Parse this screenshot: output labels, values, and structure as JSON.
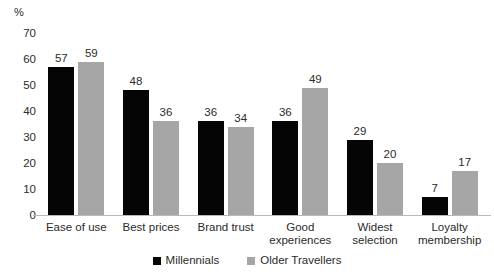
{
  "chart_data": {
    "type": "bar",
    "title": "",
    "subtitle": "",
    "xlabel": "",
    "ylabel": "%",
    "ylim": [
      0,
      70
    ],
    "yticks": [
      70,
      60,
      50,
      40,
      30,
      20,
      10,
      0
    ],
    "grid": false,
    "legend_position": "bottom",
    "categories": [
      "Ease of use",
      "Best prices",
      "Brand trust",
      "Good experiences",
      "Widest selection",
      "Loyalty membership"
    ],
    "category_lines": [
      [
        "Ease of use"
      ],
      [
        "Best prices"
      ],
      [
        "Brand trust"
      ],
      [
        "Good",
        "experiences"
      ],
      [
        "Widest",
        "selection"
      ],
      [
        "Loyalty",
        "membership"
      ]
    ],
    "series": [
      {
        "name": "Millennials",
        "color": "#050505",
        "values": [
          57,
          48,
          36,
          36,
          29,
          7
        ]
      },
      {
        "name": "Older Travellers",
        "color": "#a6a6a6",
        "values": [
          59,
          36,
          34,
          49,
          20,
          17
        ]
      }
    ]
  }
}
